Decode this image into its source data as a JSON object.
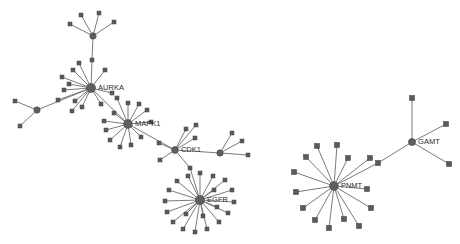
{
  "graph": {
    "title": "protein-interaction-network",
    "background_color": "#ffffff",
    "edge_color": "#6b6b6b",
    "node_color": "#5a5a5a",
    "label_color": "#2b2b2b",
    "labeled_nodes": [
      {
        "id": "AURKA",
        "label": "AURKA",
        "x": 91,
        "y": 88,
        "r": 4.6,
        "shape": "circle"
      },
      {
        "id": "MAPK1",
        "label": "MAPK1",
        "x": 128,
        "y": 124,
        "r": 4.4,
        "shape": "circle"
      },
      {
        "id": "CDK1",
        "label": "CDK1",
        "x": 175,
        "y": 150,
        "r": 3.4,
        "shape": "circle"
      },
      {
        "id": "EGFR",
        "label": "EGFR",
        "x": 200,
        "y": 200,
        "r": 4.6,
        "shape": "circle"
      },
      {
        "id": "PNMT",
        "label": "PNMT",
        "x": 334,
        "y": 186,
        "r": 4.4,
        "shape": "circle"
      },
      {
        "id": "GAMT",
        "label": "GAMT",
        "x": 412,
        "y": 142,
        "r": 3.6,
        "shape": "circle"
      }
    ],
    "unlabeled_hubs": [
      {
        "id": "H_TOP",
        "x": 93,
        "y": 36,
        "r": 3.2,
        "shape": "circle"
      },
      {
        "id": "H_LEFT",
        "x": 37,
        "y": 110,
        "r": 3.2,
        "shape": "circle"
      },
      {
        "id": "H_RIGHT",
        "x": 220,
        "y": 153,
        "r": 3.2,
        "shape": "circle"
      }
    ],
    "leaf_nodes": [
      {
        "id": "t1",
        "x": 81,
        "y": 15,
        "size": 4.0
      },
      {
        "id": "t2",
        "x": 99,
        "y": 13,
        "size": 4.0
      },
      {
        "id": "t3",
        "x": 114,
        "y": 22,
        "size": 4.0
      },
      {
        "id": "t4",
        "x": 70,
        "y": 24,
        "size": 4.0
      },
      {
        "id": "t5",
        "x": 92,
        "y": 60,
        "size": 4.0
      },
      {
        "id": "a1",
        "x": 73,
        "y": 70,
        "size": 4.0
      },
      {
        "id": "a2",
        "x": 79,
        "y": 63,
        "size": 4.0
      },
      {
        "id": "a3",
        "x": 105,
        "y": 70,
        "size": 4.0
      },
      {
        "id": "a4",
        "x": 62,
        "y": 77,
        "size": 4.0
      },
      {
        "id": "a5",
        "x": 69,
        "y": 84,
        "size": 4.0
      },
      {
        "id": "a6",
        "x": 64,
        "y": 90,
        "size": 4.0
      },
      {
        "id": "a7",
        "x": 75,
        "y": 101,
        "size": 4.0
      },
      {
        "id": "a8",
        "x": 82,
        "y": 107,
        "size": 4.0
      },
      {
        "id": "a9",
        "x": 101,
        "y": 104,
        "size": 4.0
      },
      {
        "id": "a10",
        "x": 112,
        "y": 93,
        "size": 4.0
      },
      {
        "id": "a11",
        "x": 58,
        "y": 100,
        "size": 4.0
      },
      {
        "id": "a12",
        "x": 72,
        "y": 111,
        "size": 4.0
      },
      {
        "id": "l1",
        "x": 15,
        "y": 101,
        "size": 4.0
      },
      {
        "id": "l2",
        "x": 20,
        "y": 126,
        "size": 4.0
      },
      {
        "id": "m1",
        "x": 128,
        "y": 103,
        "size": 4.0
      },
      {
        "id": "m2",
        "x": 139,
        "y": 104,
        "size": 4.0
      },
      {
        "id": "m3",
        "x": 147,
        "y": 110,
        "size": 4.0
      },
      {
        "id": "m4",
        "x": 151,
        "y": 122,
        "size": 4.0
      },
      {
        "id": "m5",
        "x": 114,
        "y": 113,
        "size": 4.0
      },
      {
        "id": "m6",
        "x": 106,
        "y": 130,
        "size": 4.0
      },
      {
        "id": "m7",
        "x": 110,
        "y": 140,
        "size": 4.0
      },
      {
        "id": "m8",
        "x": 120,
        "y": 147,
        "size": 4.0
      },
      {
        "id": "m9",
        "x": 131,
        "y": 145,
        "size": 4.0
      },
      {
        "id": "m10",
        "x": 141,
        "y": 137,
        "size": 4.0
      },
      {
        "id": "m11",
        "x": 104,
        "y": 121,
        "size": 4.0
      },
      {
        "id": "m12",
        "x": 117,
        "y": 98,
        "size": 4.0
      },
      {
        "id": "c1",
        "x": 186,
        "y": 129,
        "size": 4.0
      },
      {
        "id": "c2",
        "x": 196,
        "y": 125,
        "size": 4.0
      },
      {
        "id": "c3",
        "x": 195,
        "y": 138,
        "size": 4.0
      },
      {
        "id": "c4",
        "x": 159,
        "y": 143,
        "size": 4.0
      },
      {
        "id": "c5",
        "x": 160,
        "y": 160,
        "size": 4.0
      },
      {
        "id": "c6",
        "x": 190,
        "y": 168,
        "size": 4.0
      },
      {
        "id": "r1",
        "x": 232,
        "y": 133,
        "size": 4.0
      },
      {
        "id": "r2",
        "x": 242,
        "y": 141,
        "size": 4.0
      },
      {
        "id": "r3",
        "x": 248,
        "y": 155,
        "size": 4.0
      },
      {
        "id": "e1",
        "x": 200,
        "y": 173,
        "size": 4.0
      },
      {
        "id": "e2",
        "x": 213,
        "y": 176,
        "size": 4.0
      },
      {
        "id": "e3",
        "x": 225,
        "y": 180,
        "size": 4.0
      },
      {
        "id": "e4",
        "x": 232,
        "y": 190,
        "size": 4.0
      },
      {
        "id": "e5",
        "x": 234,
        "y": 202,
        "size": 4.0
      },
      {
        "id": "e6",
        "x": 228,
        "y": 213,
        "size": 4.0
      },
      {
        "id": "e7",
        "x": 219,
        "y": 222,
        "size": 4.0
      },
      {
        "id": "e8",
        "x": 207,
        "y": 229,
        "size": 4.0
      },
      {
        "id": "e9",
        "x": 195,
        "y": 232,
        "size": 4.0
      },
      {
        "id": "e10",
        "x": 183,
        "y": 229,
        "size": 4.0
      },
      {
        "id": "e11",
        "x": 173,
        "y": 222,
        "size": 4.0
      },
      {
        "id": "e12",
        "x": 167,
        "y": 212,
        "size": 4.0
      },
      {
        "id": "e13",
        "x": 165,
        "y": 201,
        "size": 4.0
      },
      {
        "id": "e14",
        "x": 169,
        "y": 190,
        "size": 4.0
      },
      {
        "id": "e15",
        "x": 177,
        "y": 181,
        "size": 4.0
      },
      {
        "id": "e16",
        "x": 188,
        "y": 176,
        "size": 4.0
      },
      {
        "id": "e17",
        "x": 214,
        "y": 190,
        "size": 4.0
      },
      {
        "id": "e18",
        "x": 217,
        "y": 207,
        "size": 4.0
      },
      {
        "id": "e19",
        "x": 186,
        "y": 214,
        "size": 4.0
      },
      {
        "id": "e20",
        "x": 203,
        "y": 216,
        "size": 4.0
      },
      {
        "id": "p1",
        "x": 317,
        "y": 146,
        "size": 5.2
      },
      {
        "id": "p2",
        "x": 337,
        "y": 145,
        "size": 5.2
      },
      {
        "id": "p3",
        "x": 348,
        "y": 158,
        "size": 5.2
      },
      {
        "id": "p4",
        "x": 306,
        "y": 157,
        "size": 5.2
      },
      {
        "id": "p5",
        "x": 294,
        "y": 172,
        "size": 5.2
      },
      {
        "id": "p6",
        "x": 296,
        "y": 192,
        "size": 5.2
      },
      {
        "id": "p7",
        "x": 303,
        "y": 208,
        "size": 5.2
      },
      {
        "id": "p8",
        "x": 315,
        "y": 220,
        "size": 5.2
      },
      {
        "id": "p9",
        "x": 329,
        "y": 228,
        "size": 5.2
      },
      {
        "id": "p10",
        "x": 344,
        "y": 219,
        "size": 5.2
      },
      {
        "id": "p11",
        "x": 359,
        "y": 226,
        "size": 5.2
      },
      {
        "id": "p12",
        "x": 371,
        "y": 208,
        "size": 5.2
      },
      {
        "id": "p13",
        "x": 367,
        "y": 189,
        "size": 5.2
      },
      {
        "id": "p14",
        "x": 370,
        "y": 158,
        "size": 5.2
      },
      {
        "id": "g1",
        "x": 412,
        "y": 98,
        "size": 5.2
      },
      {
        "id": "g2",
        "x": 446,
        "y": 124,
        "size": 5.2
      },
      {
        "id": "g3",
        "x": 449,
        "y": 164,
        "size": 5.2
      },
      {
        "id": "g4",
        "x": 378,
        "y": 163,
        "size": 5.2
      }
    ],
    "edges": [
      {
        "from": "H_TOP",
        "to": "t1"
      },
      {
        "from": "H_TOP",
        "to": "t2"
      },
      {
        "from": "H_TOP",
        "to": "t3"
      },
      {
        "from": "H_TOP",
        "to": "t4"
      },
      {
        "from": "H_TOP",
        "to": "t5"
      },
      {
        "from": "t5",
        "to": "AURKA"
      },
      {
        "from": "AURKA",
        "to": "a1"
      },
      {
        "from": "AURKA",
        "to": "a2"
      },
      {
        "from": "AURKA",
        "to": "a3"
      },
      {
        "from": "AURKA",
        "to": "a4"
      },
      {
        "from": "AURKA",
        "to": "a5"
      },
      {
        "from": "AURKA",
        "to": "a6"
      },
      {
        "from": "AURKA",
        "to": "a7"
      },
      {
        "from": "AURKA",
        "to": "a8"
      },
      {
        "from": "AURKA",
        "to": "a9"
      },
      {
        "from": "AURKA",
        "to": "a10"
      },
      {
        "from": "AURKA",
        "to": "a11"
      },
      {
        "from": "AURKA",
        "to": "a12"
      },
      {
        "from": "AURKA",
        "to": "H_LEFT"
      },
      {
        "from": "AURKA",
        "to": "MAPK1"
      },
      {
        "from": "H_LEFT",
        "to": "l1"
      },
      {
        "from": "H_LEFT",
        "to": "l2"
      },
      {
        "from": "MAPK1",
        "to": "m1"
      },
      {
        "from": "MAPK1",
        "to": "m2"
      },
      {
        "from": "MAPK1",
        "to": "m3"
      },
      {
        "from": "MAPK1",
        "to": "m4"
      },
      {
        "from": "MAPK1",
        "to": "m5"
      },
      {
        "from": "MAPK1",
        "to": "m6"
      },
      {
        "from": "MAPK1",
        "to": "m7"
      },
      {
        "from": "MAPK1",
        "to": "m8"
      },
      {
        "from": "MAPK1",
        "to": "m9"
      },
      {
        "from": "MAPK1",
        "to": "m10"
      },
      {
        "from": "MAPK1",
        "to": "m11"
      },
      {
        "from": "MAPK1",
        "to": "m12"
      },
      {
        "from": "MAPK1",
        "to": "CDK1"
      },
      {
        "from": "CDK1",
        "to": "c1"
      },
      {
        "from": "CDK1",
        "to": "c2"
      },
      {
        "from": "CDK1",
        "to": "c3"
      },
      {
        "from": "CDK1",
        "to": "c4"
      },
      {
        "from": "CDK1",
        "to": "c5"
      },
      {
        "from": "CDK1",
        "to": "c6"
      },
      {
        "from": "c6",
        "to": "EGFR"
      },
      {
        "from": "CDK1",
        "to": "H_RIGHT"
      },
      {
        "from": "H_RIGHT",
        "to": "r1"
      },
      {
        "from": "H_RIGHT",
        "to": "r2"
      },
      {
        "from": "H_RIGHT",
        "to": "r3"
      },
      {
        "from": "EGFR",
        "to": "e1"
      },
      {
        "from": "EGFR",
        "to": "e2"
      },
      {
        "from": "EGFR",
        "to": "e3"
      },
      {
        "from": "EGFR",
        "to": "e4"
      },
      {
        "from": "EGFR",
        "to": "e5"
      },
      {
        "from": "EGFR",
        "to": "e6"
      },
      {
        "from": "EGFR",
        "to": "e7"
      },
      {
        "from": "EGFR",
        "to": "e8"
      },
      {
        "from": "EGFR",
        "to": "e9"
      },
      {
        "from": "EGFR",
        "to": "e10"
      },
      {
        "from": "EGFR",
        "to": "e11"
      },
      {
        "from": "EGFR",
        "to": "e12"
      },
      {
        "from": "EGFR",
        "to": "e13"
      },
      {
        "from": "EGFR",
        "to": "e14"
      },
      {
        "from": "EGFR",
        "to": "e15"
      },
      {
        "from": "EGFR",
        "to": "e16"
      },
      {
        "from": "EGFR",
        "to": "e17"
      },
      {
        "from": "EGFR",
        "to": "e18"
      },
      {
        "from": "EGFR",
        "to": "e19"
      },
      {
        "from": "EGFR",
        "to": "e20"
      },
      {
        "from": "PNMT",
        "to": "p1"
      },
      {
        "from": "PNMT",
        "to": "p2"
      },
      {
        "from": "PNMT",
        "to": "p3"
      },
      {
        "from": "PNMT",
        "to": "p4"
      },
      {
        "from": "PNMT",
        "to": "p5"
      },
      {
        "from": "PNMT",
        "to": "p6"
      },
      {
        "from": "PNMT",
        "to": "p7"
      },
      {
        "from": "PNMT",
        "to": "p8"
      },
      {
        "from": "PNMT",
        "to": "p9"
      },
      {
        "from": "PNMT",
        "to": "p10"
      },
      {
        "from": "PNMT",
        "to": "p11"
      },
      {
        "from": "PNMT",
        "to": "p12"
      },
      {
        "from": "PNMT",
        "to": "p13"
      },
      {
        "from": "PNMT",
        "to": "p14"
      },
      {
        "from": "PNMT",
        "to": "g4"
      },
      {
        "from": "g4",
        "to": "GAMT"
      },
      {
        "from": "GAMT",
        "to": "g1"
      },
      {
        "from": "GAMT",
        "to": "g2"
      },
      {
        "from": "GAMT",
        "to": "g3"
      }
    ]
  }
}
